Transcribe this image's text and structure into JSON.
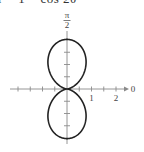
{
  "equation": "r = 1 − cos 2θ",
  "chart_data": {
    "type": "line",
    "subtype": "polar",
    "title": "r = 1 − cos 2θ",
    "function": "r = 1 - cos(2θ)",
    "theta_range": [
      0,
      6.2832
    ],
    "polar_axis_label": "0",
    "vertical_axis_label": "π/2",
    "radial_tick_labels": [
      "1",
      "2"
    ],
    "radial_ticks": [
      0.5,
      1,
      1.5,
      2
    ],
    "r_max": 2,
    "grid": false,
    "curve_color": "#222222",
    "axis_color": "#8a8a8a"
  },
  "labels": {
    "pi": "π",
    "two": "2",
    "zero": "0",
    "one": "1",
    "two_tick": "2"
  }
}
